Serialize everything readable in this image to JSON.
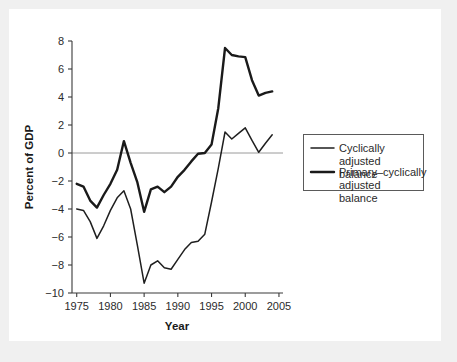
{
  "chart_data": {
    "type": "line",
    "title": "",
    "xlabel": "Year",
    "ylabel": "Percent of GDP",
    "xlim": [
      1974.3,
      2005.6
    ],
    "ylim": [
      -10,
      8
    ],
    "xticks": [
      1975,
      1980,
      1985,
      1990,
      1995,
      2000,
      2005
    ],
    "yticks": [
      8,
      6,
      4,
      2,
      0,
      -2,
      -4,
      -6,
      -8,
      -10
    ],
    "xtick_labels": [
      "1975",
      "1980",
      "1985",
      "1990",
      "1995",
      "2000",
      "2005"
    ],
    "ytick_labels": [
      "8",
      "6",
      "4",
      "2",
      "0",
      "-2",
      "-4",
      "-6",
      "-8",
      "-10"
    ],
    "grid": false,
    "zero_line": 0,
    "legend_position": "right",
    "x": [
      1975,
      1976,
      1977,
      1978,
      1979,
      1980,
      1981,
      1982,
      1983,
      1984,
      1985,
      1986,
      1987,
      1988,
      1989,
      1990,
      1991,
      1992,
      1993,
      1994,
      1995,
      1996,
      1997,
      1998,
      1999,
      2000,
      2001,
      2002,
      2003,
      2004
    ],
    "series": [
      {
        "name": "Cyclically adjusted balance",
        "style": "thin",
        "values": [
          -4.0,
          -4.1,
          -4.9,
          -6.1,
          -5.2,
          -4.1,
          -3.2,
          -2.7,
          -4.0,
          -6.6,
          -9.3,
          -8.0,
          -7.7,
          -8.2,
          -8.3,
          -7.6,
          -6.9,
          -6.4,
          -6.3,
          -5.8,
          -3.5,
          -1.1,
          1.5,
          1.0,
          1.4,
          1.8,
          0.9,
          0.05,
          0.7,
          1.3
        ]
      },
      {
        "name": "Primary–cyclically adjusted balance",
        "style": "thick",
        "values": [
          -2.2,
          -2.4,
          -3.4,
          -3.9,
          -3.0,
          -2.2,
          -1.2,
          0.85,
          -0.7,
          -2.1,
          -4.2,
          -2.6,
          -2.4,
          -2.8,
          -2.4,
          -1.7,
          -1.2,
          -0.6,
          -0.05,
          0.0,
          0.6,
          3.2,
          7.5,
          7.0,
          6.9,
          6.85,
          5.2,
          4.1,
          4.3,
          4.4
        ]
      }
    ],
    "legend_entries": [
      "Cyclically adjusted balance",
      "Primary–cyclically adjusted balance"
    ]
  },
  "colors": {
    "background": "#f0f0f0",
    "card": "#ffffff",
    "axis": "#3a3a3a",
    "zero_line": "#9a9a9a",
    "series_thin": "#1f1f1f",
    "series_thick": "#1a1a1a",
    "text": "#2b2b2b"
  }
}
